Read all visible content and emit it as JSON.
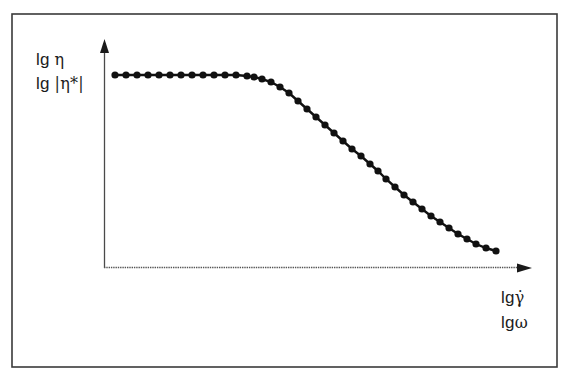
{
  "figure": {
    "y_axis_labels": {
      "line1_prefix": "lg ",
      "line1_symbol": "η",
      "line2_prefix": "lg ",
      "line2_symbol": "|η*|"
    },
    "x_axis_labels": {
      "line1_prefix": "lg",
      "line1_symbol": "γ̇",
      "line2_prefix": "lg",
      "line2_symbol": "ω"
    },
    "colors": {
      "frame": "#3a3a3a",
      "axis": "#4a4a4a",
      "curve": "#111111",
      "background": "#ffffff"
    }
  },
  "chart_data": {
    "type": "line",
    "title": "",
    "xlabel": "lg γ̇ / lg ω",
    "ylabel": "lg η / lg |η*|",
    "grid": false,
    "legend": null,
    "ticks": "none",
    "axis_ranges": {
      "x": [
        0,
        426
      ],
      "y": [
        0,
        227
      ]
    },
    "units": "arbitrary (relative pixel units from origin)",
    "points": [
      [
        10,
        192
      ],
      [
        21,
        192
      ],
      [
        32,
        192
      ],
      [
        43,
        192
      ],
      [
        54,
        192
      ],
      [
        65,
        192
      ],
      [
        76,
        192
      ],
      [
        87,
        192
      ],
      [
        98,
        192
      ],
      [
        109,
        192
      ],
      [
        120,
        192
      ],
      [
        131,
        192
      ],
      [
        142,
        191
      ],
      [
        149,
        190
      ],
      [
        157,
        188
      ],
      [
        166,
        185
      ],
      [
        175,
        180
      ],
      [
        184,
        174
      ],
      [
        193,
        166
      ],
      [
        202,
        158
      ],
      [
        211,
        150
      ],
      [
        220,
        142
      ],
      [
        229,
        134
      ],
      [
        238,
        126
      ],
      [
        247,
        118
      ],
      [
        256,
        111
      ],
      [
        265,
        103
      ],
      [
        273,
        96
      ],
      [
        281,
        88
      ],
      [
        290,
        80
      ],
      [
        299,
        72
      ],
      [
        308,
        65
      ],
      [
        317,
        58
      ],
      [
        326,
        51
      ],
      [
        335,
        45
      ],
      [
        344,
        39
      ],
      [
        353,
        33
      ],
      [
        362,
        28
      ],
      [
        371,
        23
      ],
      [
        381,
        19
      ],
      [
        391,
        16
      ]
    ]
  }
}
